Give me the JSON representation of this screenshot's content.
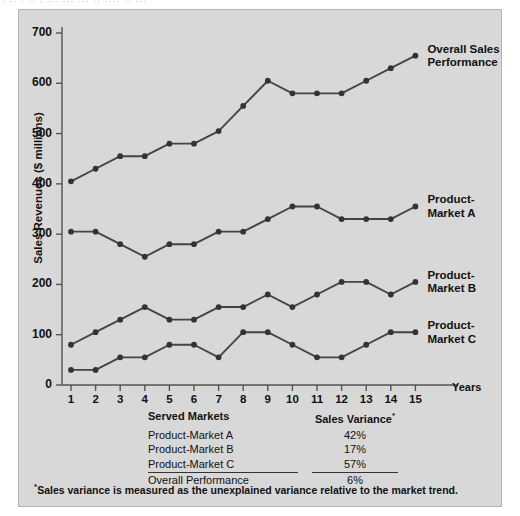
{
  "top_fragment": "· ·· · ·· · ··· ··· ··· ·· ···· ·· ···",
  "chart_data": {
    "type": "line",
    "title": "",
    "xlabel": "Years",
    "ylabel": "Sales Revenues ($ millions)",
    "x": [
      1,
      2,
      3,
      4,
      5,
      6,
      7,
      8,
      9,
      10,
      11,
      12,
      13,
      14,
      15
    ],
    "xlim": [
      0,
      15.8
    ],
    "ylim": [
      0,
      700
    ],
    "yticks": [
      0,
      100,
      200,
      300,
      400,
      500,
      600,
      700
    ],
    "xticks": [
      "1",
      "2",
      "3",
      "4",
      "5",
      "6",
      "7",
      "8",
      "9",
      "10",
      "11",
      "12",
      "13",
      "14",
      "15"
    ],
    "grid": false,
    "legend": "right-inline",
    "series": [
      {
        "name": "Overall Sales Performance",
        "values": [
          405,
          430,
          455,
          455,
          480,
          480,
          505,
          555,
          605,
          580,
          580,
          580,
          605,
          630,
          655
        ]
      },
      {
        "name": "Product-Market A",
        "values": [
          305,
          305,
          280,
          255,
          280,
          280,
          305,
          305,
          330,
          355,
          355,
          330,
          330,
          330,
          355
        ]
      },
      {
        "name": "Product-Market B",
        "values": [
          80,
          105,
          130,
          155,
          130,
          130,
          155,
          155,
          180,
          155,
          180,
          205,
          205,
          180,
          205
        ]
      },
      {
        "name": "Product-Market C",
        "values": [
          30,
          30,
          55,
          55,
          80,
          80,
          55,
          105,
          105,
          80,
          55,
          55,
          80,
          105,
          105
        ]
      }
    ],
    "colors": {
      "line": "#444444",
      "marker": "#333333",
      "panel_background": "#d8d8d8",
      "panel_border": "#b4b4b4",
      "axis": "#555555",
      "text": "#111111"
    }
  },
  "table": {
    "header": {
      "markets": "Served Markets",
      "variance": "Sales Variance",
      "variance_sup": "*"
    },
    "rows": [
      {
        "market": "Product-Market A",
        "variance": "42%"
      },
      {
        "market": "Product-Market B",
        "variance": "17%"
      },
      {
        "market": "Product-Market C",
        "variance": "57%"
      },
      {
        "market": "Overall Performance",
        "variance": "6%"
      }
    ]
  },
  "footnote": {
    "marker": "*",
    "text": "Sales variance is measured as the unexplained variance relative to the market trend."
  }
}
